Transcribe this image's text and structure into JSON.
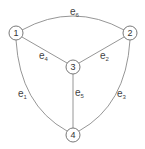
{
  "diagram": {
    "type": "graph",
    "colors": {
      "edge": "#8a8a8a",
      "node_stroke": "#6a6a6a",
      "text": "#333333",
      "background": "#ffffff"
    },
    "nodes": [
      {
        "id": "1",
        "label": "1",
        "x": 16,
        "y": 33
      },
      {
        "id": "2",
        "label": "2",
        "x": 130,
        "y": 33
      },
      {
        "id": "3",
        "label": "3",
        "x": 73,
        "y": 67
      },
      {
        "id": "4",
        "label": "4",
        "x": 73,
        "y": 135
      }
    ],
    "edges": [
      {
        "id": "e1",
        "label_base": "e",
        "label_sub": "1",
        "from": "1",
        "to": "4",
        "shape": "curve"
      },
      {
        "id": "e2",
        "label_base": "e",
        "label_sub": "2",
        "from": "3",
        "to": "2",
        "shape": "line"
      },
      {
        "id": "e3",
        "label_base": "e",
        "label_sub": "3",
        "from": "2",
        "to": "4",
        "shape": "curve"
      },
      {
        "id": "e4",
        "label_base": "e",
        "label_sub": "4",
        "from": "1",
        "to": "3",
        "shape": "line"
      },
      {
        "id": "e5",
        "label_base": "e",
        "label_sub": "5",
        "from": "3",
        "to": "4",
        "shape": "line"
      },
      {
        "id": "e6",
        "label_base": "e",
        "label_sub": "6",
        "from": "1",
        "to": "2",
        "shape": "curve"
      }
    ]
  }
}
